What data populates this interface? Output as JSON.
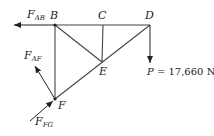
{
  "diagram": {
    "type": "truss free-body diagram",
    "joints": [
      {
        "id": "B",
        "label": "B"
      },
      {
        "id": "C",
        "label": "C"
      },
      {
        "id": "D",
        "label": "D"
      },
      {
        "id": "E",
        "label": "E"
      },
      {
        "id": "F",
        "label": "F"
      }
    ],
    "members": [
      "BC",
      "CD",
      "BE",
      "CE",
      "DE",
      "BF",
      "EF"
    ],
    "forces": [
      {
        "name": "F",
        "sub": "AB",
        "direction": "left",
        "at": "B"
      },
      {
        "name": "F",
        "sub": "AF",
        "direction": "up-left",
        "at": "F"
      },
      {
        "name": "F",
        "sub": "FG",
        "direction": "up-right (toward F)",
        "at": "F"
      },
      {
        "name": "P",
        "direction": "down",
        "at": "D",
        "value_text": " = 17,660 N"
      }
    ]
  }
}
